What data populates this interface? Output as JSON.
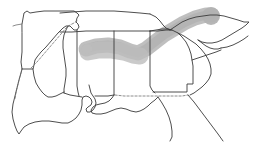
{
  "figure": {
    "width": 253,
    "height": 145,
    "background_color": "#ffffff"
  },
  "styles": {
    "outline_color": "#3a3a3a",
    "light_outline_color": "#6e6e6e",
    "highlight_color": "#b5b5b5",
    "highlight_color_soft": "#c2c2c2",
    "outline_width": 0.9,
    "dash_pattern": "2.2 1.8"
  },
  "map": {
    "region_name": "Southeastern United States",
    "states": [
      {
        "name": "Arkansas",
        "abbr": "AR"
      },
      {
        "name": "Louisiana",
        "abbr": "LA"
      },
      {
        "name": "Mississippi",
        "abbr": "MS"
      },
      {
        "name": "Alabama",
        "abbr": "AL"
      },
      {
        "name": "Tennessee",
        "abbr": "TN"
      },
      {
        "name": "Georgia",
        "abbr": "GA"
      },
      {
        "name": "South Carolina",
        "abbr": "SC"
      },
      {
        "name": "North Carolina",
        "abbr": "NC"
      },
      {
        "name": "Florida",
        "abbr": "FL"
      }
    ],
    "features": [
      {
        "name": "mississippi-river",
        "style": "dashed"
      },
      {
        "name": "georgia-florida-border",
        "style": "dashed"
      },
      {
        "name": "gulf-coastline",
        "style": "solid"
      },
      {
        "name": "atlantic-coastline",
        "style": "solid"
      }
    ]
  },
  "highlight": {
    "name": "highlighted-corridor",
    "description": "Gray shaded band running west-northeast from Mississippi across Alabama and Georgia into North Carolina",
    "color": "#b5b5b5",
    "start_state": "Mississippi",
    "end_state": "North Carolina",
    "terminal_blob": {
      "x": 211,
      "y": 16,
      "radius": 9
    }
  },
  "geometry": {
    "arkansas": "M 22 24 L 24 13 L 27 11 L 30 13 L 36 12 L 44 11 L 52 11 L 60 11 L 68 11 L 74 11 L 77 13 L 79 15 L 77 18 L 76 22 L 78 24 L 79 27 L 77 30 L 74 30 L 72 28 L 70 26 L 66 26 L 63 28 L 58 33 L 52 40 L 46 47 L 41 52 L 37 57 L 35 60 L 34 65 L 33 69 L 22 69 L 21 62 L 22 52 L 22 41 L 22 33 Z",
    "arkansas_west": "M 22 24 L 22 69",
    "missouri_spur": "M 22 24 L 16 25 L 13 26",
    "ark_south": "M 22 69 L 33 69",
    "louisiana": "M 22 69 L 21 73 L 19 80 L 17 88 L 15 96 L 13 104 L 12 112 L 13 119 L 15 126 L 17 131 L 19 134 L 21 131 L 24 127 L 29 124 L 35 122 L 42 121 L 49 121 L 56 122 L 62 123 L 68 123 L 72 121 L 76 118 L 79 114 L 81 110 L 82 105 L 82 100 L 83 97 L 86 96 L 89 97 L 91 99 L 92 102 L 91 105 L 88 107 L 86 109 L 87 112 L 90 112 L 93 110 L 95 107 L 96 103 L 95 99 L 93 96 L 91 93 L 90 89 L 89 85",
    "la_east_border": "M 33 69 L 34 76 L 36 83 L 39 88 L 42 92 L 45 95 L 48 97 L 52 97 L 56 96 L 60 94 L 64 92",
    "mississippi": "M 77 30 L 77 38 L 77 48 L 77 58 L 77 68 L 77 78 L 77 86 L 78 92 L 79 96",
    "ms_west": "M 68 26 L 66 30 L 64 35 L 63 41 L 63 48 L 64 55 L 65 62 L 66 69 L 66 76 L 65 83 L 64 89 L 64 93",
    "ms_gulf": "M 64 93 L 70 95 L 76 96 L 82 97",
    "tennessee_south": "M 60 32 L 72 32 L 86 31 L 100 31 L 114 31 L 128 31 L 140 31 L 150 31",
    "tennessee_north": "M 60 13 L 72 12 L 86 11 L 100 11 L 114 11 L 128 12 L 140 13 L 150 14",
    "tn_nc_edge": "M 150 14 L 156 17 L 160 21 L 163 25 L 166 28 L 170 30",
    "tn_east": "M 150 31 L 156 30 L 162 29 L 168 29 L 172 30",
    "alabama": "M 114 31 L 114 42 L 114 52 L 114 62 L 114 72 L 114 82 L 114 90 L 114 95",
    "al_gulf": "M 95 96 L 102 96 L 108 96 L 114 95",
    "al_ga_border": "M 150 31 L 150 40 L 150 50 L 150 60 L 150 70 L 150 80 L 150 86 L 152 90 L 155 93",
    "georgia": "M 150 31 L 158 31 L 166 30 L 172 30 L 178 33 L 182 37 L 186 42 L 189 48 L 191 54 L 192 60 L 193 66 L 193 72 L 193 78 L 193 84 L 190 84 L 187 84 L 187 88 L 187 92 L 182 92 L 176 92 L 170 92 L 164 92 L 158 92 L 153 92",
    "ga_fl_border": "M 115 95 L 124 96 L 134 96 L 144 96 L 154 96 L 164 96 L 174 96 L 182 96 L 188 95",
    "florida_gulf": "M 114 95 L 112 98 L 109 101 L 105 103 L 100 104 L 96 105 L 93 107 L 91 110 L 92 113 L 96 114 L 101 114 L 106 113 L 111 111 L 116 109 L 121 108 L 126 109 L 131 111 L 136 112 L 140 111 L 144 109 L 148 106 L 151 103 L 155 100 L 158 97",
    "florida_peninsula": "M 158 97 L 162 103 L 166 110 L 169 117 L 171 124 L 172 131 L 172 137 L 170 141",
    "fl_east": "M 188 95 L 194 102 L 200 110 L 206 118 L 212 126 L 218 134 L 223 141",
    "carolinas_nc": "M 170 30 L 176 26 L 182 22 L 189 19 L 196 17 L 203 16 L 210 15 L 217 15 L 224 16 L 231 18 L 238 20 L 244 22 L 249 22 L 246 25 L 242 28 L 237 31 L 232 34 L 227 37 L 222 40 L 217 42 L 212 43 L 207 43 L 202 42 L 198 40",
    "nc_sc_divide": "M 198 40 L 202 43 L 206 46 L 210 48 L 214 49 L 218 49 L 221 48",
    "sc_outline": "M 178 33 L 184 36 L 190 40 L 196 44 L 201 49 L 205 54 L 208 59 L 210 64 L 211 69 L 211 74 L 209 79 L 206 83 L 202 87 L 198 90 L 194 93 L 190 95",
    "sc_nc_inner": "M 192 60 L 198 58 L 204 56 L 210 54 L 216 52 L 221 50",
    "nc_right_tail": "M 221 48 L 227 47 L 233 45 L 239 42 L 244 39 L 248 36",
    "mississippi_river_dash": "M 31 68 L 37 62 L 43 55 L 49 48 L 55 41 L 61 34 L 66 28 L 70 25 L 74 23 L 77 21",
    "ark_dash_west": "M 22 69 L 20 76 L 18 84 L 16 92 L 15 99",
    "highlight_band": "M 86 49 L 96 46 L 108 45 L 120 47 L 130 51 L 138 53 L 146 49 L 155 42 L 164 35 L 174 29 L 184 23 L 195 18 L 206 15 L 212 15",
    "highlight_band_soft": "M 88 52 L 99 50 L 112 50 L 124 52 L 133 55 L 140 56"
  }
}
